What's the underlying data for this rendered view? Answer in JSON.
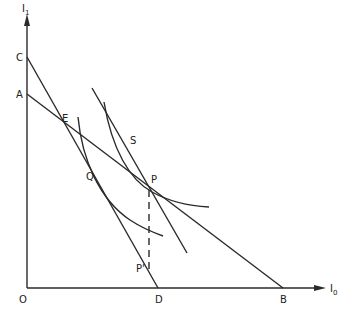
{
  "diagram": {
    "axes": {
      "y_label": "I",
      "y_sub": "1",
      "x_label": "I",
      "x_sub": "0"
    },
    "points": {
      "origin": "O",
      "c": "C",
      "a": "A",
      "e": "E",
      "q": "Q",
      "p": "P",
      "s": "S",
      "p_prime": "P'",
      "d": "D",
      "b": "B"
    },
    "colors": {
      "ink": "#2a2a2a",
      "background": "#ffffff"
    }
  }
}
